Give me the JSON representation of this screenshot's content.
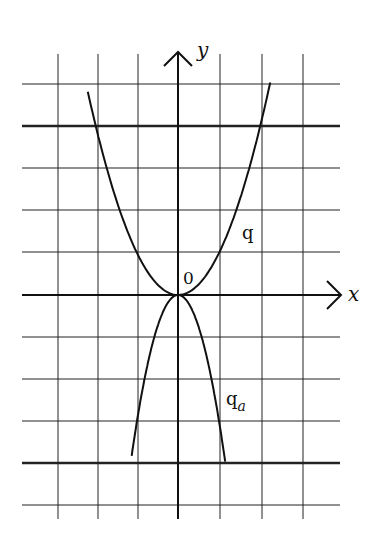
{
  "diagram": {
    "type": "function-graph",
    "origin_px": [
      178,
      295
    ],
    "unit_px": [
      41,
      42
    ],
    "grid": {
      "vertical_lines_x": [
        58,
        98,
        138,
        178,
        220,
        262,
        303
      ],
      "horizontal_lines_y": [
        84,
        126,
        168,
        210,
        252,
        295,
        337,
        379,
        421,
        463,
        505
      ],
      "thick_lines_y": [
        126,
        463
      ],
      "x_extent": [
        22,
        340
      ],
      "y_extent": [
        54,
        519
      ]
    },
    "axes": {
      "x_label": "x",
      "y_label": "y",
      "origin_label": "0"
    },
    "curves": [
      {
        "name": "q",
        "label": "q",
        "formula": "y = x^2",
        "coef": 1,
        "x_range": [
          -2.2,
          2.25
        ]
      },
      {
        "name": "q_a",
        "label": "q",
        "subscript": "a",
        "formula": "y = -3x^2",
        "coef": -3,
        "x_range": [
          -1.13,
          1.15
        ]
      }
    ],
    "colors": {
      "ink": "#111111",
      "background": "#ffffff"
    }
  }
}
